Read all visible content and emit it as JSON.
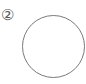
{
  "figure": {
    "label": "②",
    "shape": "circle",
    "stroke_color": "#7a7a7a",
    "fill_color": "#ffffff"
  }
}
